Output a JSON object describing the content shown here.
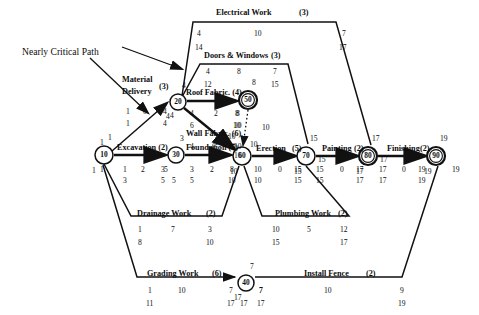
{
  "diagram": {
    "callout": {
      "label": "Nearly Critical Path"
    },
    "nodes": [
      {
        "id": "10",
        "label": "10",
        "x": 104,
        "y": 155,
        "r": 9,
        "double": false,
        "above": "1",
        "below": "1"
      },
      {
        "id": "20",
        "label": "20",
        "x": 178,
        "y": 102,
        "r": 8,
        "double": false,
        "above": "4",
        "below": "4"
      },
      {
        "id": "30",
        "label": "30",
        "x": 176,
        "y": 155,
        "r": 8,
        "double": false,
        "above": "3",
        "below": "5"
      },
      {
        "id": "40",
        "label": "40",
        "x": 246,
        "y": 283,
        "r": 8,
        "double": false,
        "above": "7",
        "below": "17"
      },
      {
        "id": "50",
        "label": "50",
        "x": 248,
        "y": 100,
        "r": 9,
        "double": true,
        "above": "8",
        "below": ""
      },
      {
        "id": "60",
        "label": "60",
        "x": 242,
        "y": 156,
        "r": 9,
        "double": false,
        "above": "",
        "below": "10"
      },
      {
        "id": "70",
        "label": "70",
        "x": 306,
        "y": 156,
        "r": 9,
        "double": false,
        "above": "15",
        "below": "15"
      },
      {
        "id": "80",
        "label": "80",
        "x": 368,
        "y": 156,
        "r": 9,
        "double": true,
        "above": "17",
        "below": "17"
      },
      {
        "id": "90",
        "label": "90",
        "x": 436,
        "y": 156,
        "r": 9,
        "double": true,
        "above": "19",
        "below": "19"
      }
    ],
    "activities": [
      {
        "name": "Material Delivery",
        "duration": "(3)",
        "early_start": "1",
        "float": "0",
        "early_finish": "4",
        "late_start": "1",
        "late_finish": "4"
      },
      {
        "name": "Roof Fabric. (4)",
        "duration": "",
        "early_start": "4",
        "float": "2",
        "early_finish": "8",
        "late_start": "6",
        "late_finish": "10"
      },
      {
        "name": "Wall Fabric. (6)",
        "duration": "",
        "early_start": "4",
        "float": "0",
        "early_finish": "10",
        "late_start": "4",
        "late_finish": "10"
      },
      {
        "name": "Excavation (2)",
        "duration": "",
        "early_start": "1",
        "float": "2",
        "early_finish": "3",
        "late_start": "3",
        "late_finish": "5"
      },
      {
        "name": "Foundation (5)",
        "duration": "",
        "early_start": "3",
        "float": "2",
        "early_finish": "8",
        "late_start": "5",
        "late_finish": "10"
      },
      {
        "name": "Erection",
        "duration": "(5)",
        "early_start": "10",
        "float": "0",
        "early_finish": "15",
        "late_start": "10",
        "late_finish": "15"
      },
      {
        "name": "Painting",
        "duration": "(2)",
        "early_start": "15",
        "float": "0",
        "early_finish": "17",
        "late_start": "15",
        "late_finish": "17"
      },
      {
        "name": "Finishing",
        "duration": "(2)",
        "early_start": "17",
        "float": "0",
        "early_finish": "19",
        "late_start": "17",
        "late_finish": "19"
      },
      {
        "name": "Electrical Work",
        "duration": "(3)",
        "early_start": "4",
        "float": "10",
        "early_finish": "7",
        "late_start": "14",
        "late_finish": "17"
      },
      {
        "name": "Doors & Windows",
        "duration": "(3)",
        "early_start": "4",
        "float": "8",
        "early_finish": "7",
        "late_start": "12",
        "late_finish": "15"
      },
      {
        "name": "Drainage Work",
        "duration": "(2)",
        "early_start": "1",
        "float": "7",
        "early_finish": "3",
        "late_start": "8",
        "late_finish": "10"
      },
      {
        "name": "Plumbing Work",
        "duration": "(2)",
        "early_start": "10",
        "float": "5",
        "early_finish": "12",
        "late_start": "15",
        "late_finish": "17"
      },
      {
        "name": "Grading Work",
        "duration": "(6)",
        "early_start": "1",
        "float": "10",
        "early_finish": "7",
        "late_start": "11",
        "late_finish": "17"
      },
      {
        "name": "Install Fence",
        "duration": "(2)",
        "early_start": "7",
        "float": "10",
        "early_finish": "9",
        "late_start": "17",
        "late_finish": "19"
      }
    ],
    "text_labels": [
      {
        "key": "callout_text",
        "text": "Nearly Critical Path",
        "x": 22,
        "y": 47,
        "cls": "callout"
      },
      {
        "key": "electrical_name",
        "text": "Electrical Work",
        "x": 216,
        "y": 9,
        "cls": "act"
      },
      {
        "key": "electrical_dur",
        "text": "(3)",
        "x": 299,
        "y": 9,
        "cls": "dur"
      },
      {
        "key": "electrical_es",
        "text": "4",
        "x": 197,
        "y": 30,
        "cls": "num"
      },
      {
        "key": "electrical_ls",
        "text": "14",
        "x": 195,
        "y": 44,
        "cls": "num"
      },
      {
        "key": "electrical_d",
        "text": "10",
        "x": 254,
        "y": 30,
        "cls": "num"
      },
      {
        "key": "electrical_ef",
        "text": "7",
        "x": 342,
        "y": 30,
        "cls": "num"
      },
      {
        "key": "electrical_lf",
        "text": "17",
        "x": 339,
        "y": 44,
        "cls": "num"
      },
      {
        "key": "doors_name",
        "text": "Doors & Windows",
        "x": 204,
        "y": 52,
        "cls": "act"
      },
      {
        "key": "doors_dur",
        "text": "(3)",
        "x": 271,
        "y": 52,
        "cls": "dur"
      },
      {
        "key": "doors_es",
        "text": "4",
        "x": 206,
        "y": 68,
        "cls": "num"
      },
      {
        "key": "doors_ls",
        "text": "12",
        "x": 204,
        "y": 81,
        "cls": "num"
      },
      {
        "key": "doors_d",
        "text": "8",
        "x": 237,
        "y": 68,
        "cls": "num"
      },
      {
        "key": "doors_ef",
        "text": "7",
        "x": 273,
        "y": 68,
        "cls": "num"
      },
      {
        "key": "doors_lf",
        "text": "15",
        "x": 271,
        "y": 81,
        "cls": "num"
      },
      {
        "key": "matdel_name1",
        "text": "Material",
        "x": 122,
        "y": 76,
        "cls": "act"
      },
      {
        "key": "matdel_name2",
        "text": "Delivery",
        "x": 122,
        "y": 88,
        "cls": "act"
      },
      {
        "key": "matdel_dur",
        "text": "(3)",
        "x": 159,
        "y": 83,
        "cls": "dur"
      },
      {
        "key": "matdel_es",
        "text": "1",
        "x": 126,
        "y": 108,
        "cls": "num"
      },
      {
        "key": "matdel_ls",
        "text": "1",
        "x": 126,
        "y": 120,
        "cls": "num"
      },
      {
        "key": "matdel_float",
        "text": "0",
        "x": 143,
        "y": 108,
        "cls": "num"
      },
      {
        "key": "matdel_ef",
        "text": "4",
        "x": 163,
        "y": 108,
        "cls": "num"
      },
      {
        "key": "matdel_lf",
        "text": "4",
        "x": 163,
        "y": 120,
        "cls": "num"
      },
      {
        "key": "roof_name",
        "text": "Roof Fabric. (4)",
        "x": 186,
        "y": 89,
        "cls": "act"
      },
      {
        "key": "roof_es",
        "text": "4",
        "x": 190,
        "y": 110,
        "cls": "num"
      },
      {
        "key": "roof_ls",
        "text": "6",
        "x": 190,
        "y": 122,
        "cls": "num"
      },
      {
        "key": "roof_float",
        "text": "2",
        "x": 214,
        "y": 110,
        "cls": "num"
      },
      {
        "key": "roof_ef",
        "text": "8",
        "x": 236,
        "y": 110,
        "cls": "num"
      },
      {
        "key": "roof_lf",
        "text": "10",
        "x": 234,
        "y": 122,
        "cls": "num"
      },
      {
        "key": "wall_name",
        "text": "Wall Fabric. (6)",
        "x": 186,
        "y": 130,
        "cls": "act"
      },
      {
        "key": "wall_es",
        "text": "4",
        "x": 190,
        "y": 143,
        "cls": "num"
      },
      {
        "key": "wall_float",
        "text": "0",
        "x": 212,
        "y": 143,
        "cls": "num"
      },
      {
        "key": "wall_ef",
        "text": "10",
        "x": 234,
        "y": 143,
        "cls": "num"
      },
      {
        "key": "wall_lf",
        "text": "10",
        "x": 234,
        "y": 152,
        "cls": "num"
      },
      {
        "key": "exc_name",
        "text": "Excavation (2)",
        "x": 117,
        "y": 144,
        "cls": "act"
      },
      {
        "key": "exc_left",
        "text": "1",
        "x": 100,
        "y": 139,
        "cls": "num"
      },
      {
        "key": "exc_es",
        "text": "1",
        "x": 123,
        "y": 166,
        "cls": "num"
      },
      {
        "key": "exc_ls",
        "text": "1",
        "x": 100,
        "y": 166,
        "cls": "num"
      },
      {
        "key": "exc_float",
        "text": "2",
        "x": 141,
        "y": 166,
        "cls": "num"
      },
      {
        "key": "exc_ef",
        "text": "3",
        "x": 161,
        "y": 166,
        "cls": "num"
      },
      {
        "key": "exc_d2",
        "text": "3",
        "x": 123,
        "y": 177,
        "cls": "num"
      },
      {
        "key": "exc_lf",
        "text": "5",
        "x": 161,
        "y": 177,
        "cls": "num"
      },
      {
        "key": "found_name",
        "text": "Foundation (5)",
        "x": 186,
        "y": 144,
        "cls": "act"
      },
      {
        "key": "found_es",
        "text": "3",
        "x": 190,
        "y": 166,
        "cls": "num"
      },
      {
        "key": "found_ls",
        "text": "5",
        "x": 190,
        "y": 177,
        "cls": "num"
      },
      {
        "key": "found_float",
        "text": "2",
        "x": 210,
        "y": 166,
        "cls": "num"
      },
      {
        "key": "found_ef",
        "text": "8",
        "x": 230,
        "y": 166,
        "cls": "num"
      },
      {
        "key": "found_lf",
        "text": "10",
        "x": 228,
        "y": 177,
        "cls": "num"
      },
      {
        "key": "n30_left_ef",
        "text": "5",
        "x": 172,
        "y": 177,
        "cls": "num"
      },
      {
        "key": "n20_dummy",
        "text": "4",
        "x": 170,
        "y": 112,
        "cls": "num"
      },
      {
        "key": "n50_right",
        "text": "10",
        "x": 262,
        "y": 124,
        "cls": "num"
      },
      {
        "key": "n50_below1",
        "text": "8",
        "x": 235,
        "y": 110,
        "cls": "num"
      },
      {
        "key": "n50_below2",
        "text": "10",
        "x": 233,
        "y": 122,
        "cls": "num"
      },
      {
        "key": "dummy_val",
        "text": "10",
        "x": 250,
        "y": 141,
        "cls": "num"
      },
      {
        "key": "n60_above1",
        "text": "10",
        "x": 228,
        "y": 133,
        "cls": "num"
      },
      {
        "key": "n60_above2",
        "text": "10",
        "x": 228,
        "y": 143,
        "cls": "num"
      },
      {
        "key": "erect_name",
        "text": "Erection",
        "x": 256,
        "y": 145,
        "cls": "act"
      },
      {
        "key": "erect_dur",
        "text": "(5)",
        "x": 292,
        "y": 145,
        "cls": "dur"
      },
      {
        "key": "erect_es",
        "text": "10",
        "x": 254,
        "y": 166,
        "cls": "num"
      },
      {
        "key": "erect_ls",
        "text": "10",
        "x": 254,
        "y": 177,
        "cls": "num"
      },
      {
        "key": "erect_float",
        "text": "0",
        "x": 278,
        "y": 166,
        "cls": "num"
      },
      {
        "key": "erect_ef",
        "text": "15",
        "x": 294,
        "y": 166,
        "cls": "num"
      },
      {
        "key": "erect_lf",
        "text": "15",
        "x": 294,
        "y": 177,
        "cls": "num"
      },
      {
        "key": "paint_name",
        "text": "Painting",
        "x": 322,
        "y": 145,
        "cls": "act"
      },
      {
        "key": "paint_dur",
        "text": "(2)",
        "x": 354,
        "y": 145,
        "cls": "dur"
      },
      {
        "key": "paint_es",
        "text": "15",
        "x": 316,
        "y": 166,
        "cls": "num"
      },
      {
        "key": "paint_ls",
        "text": "15",
        "x": 316,
        "y": 177,
        "cls": "num"
      },
      {
        "key": "paint_float",
        "text": "0",
        "x": 340,
        "y": 166,
        "cls": "num"
      },
      {
        "key": "paint_ef",
        "text": "17",
        "x": 356,
        "y": 166,
        "cls": "num"
      },
      {
        "key": "paint_lf",
        "text": "17",
        "x": 356,
        "y": 177,
        "cls": "num"
      },
      {
        "key": "fin_name",
        "text": "Finishing",
        "x": 387,
        "y": 145,
        "cls": "act"
      },
      {
        "key": "fin_dur",
        "text": "(2)",
        "x": 420,
        "y": 145,
        "cls": "dur"
      },
      {
        "key": "fin_es",
        "text": "17",
        "x": 379,
        "y": 166,
        "cls": "num"
      },
      {
        "key": "fin_ls",
        "text": "17",
        "x": 379,
        "y": 177,
        "cls": "num"
      },
      {
        "key": "fin_float",
        "text": "0",
        "x": 402,
        "y": 166,
        "cls": "num"
      },
      {
        "key": "fin_ef",
        "text": "19",
        "x": 418,
        "y": 166,
        "cls": "num"
      },
      {
        "key": "fin_lf",
        "text": "19",
        "x": 418,
        "y": 177,
        "cls": "num"
      },
      {
        "key": "n90_right",
        "text": "19",
        "x": 452,
        "y": 166,
        "cls": "num"
      },
      {
        "key": "n70_right",
        "text": "15",
        "x": 318,
        "y": 156,
        "cls": "num"
      },
      {
        "key": "n80_right",
        "text": "17",
        "x": 380,
        "y": 156,
        "cls": "num"
      },
      {
        "key": "drain_name",
        "text": "Drainage Work",
        "x": 137,
        "y": 210,
        "cls": "act"
      },
      {
        "key": "drain_dur",
        "text": "(2)",
        "x": 206,
        "y": 210,
        "cls": "dur"
      },
      {
        "key": "drain_es",
        "text": "1",
        "x": 138,
        "y": 226,
        "cls": "num"
      },
      {
        "key": "drain_ls",
        "text": "8",
        "x": 138,
        "y": 239,
        "cls": "num"
      },
      {
        "key": "drain_d",
        "text": "7",
        "x": 171,
        "y": 226,
        "cls": "num"
      },
      {
        "key": "drain_ef",
        "text": "3",
        "x": 208,
        "y": 226,
        "cls": "num"
      },
      {
        "key": "drain_lf",
        "text": "10",
        "x": 206,
        "y": 239,
        "cls": "num"
      },
      {
        "key": "plumb_name",
        "text": "Plumbing Work",
        "x": 275,
        "y": 210,
        "cls": "act"
      },
      {
        "key": "plumb_dur",
        "text": "(2)",
        "x": 338,
        "y": 210,
        "cls": "dur"
      },
      {
        "key": "plumb_es",
        "text": "10",
        "x": 272,
        "y": 226,
        "cls": "num"
      },
      {
        "key": "plumb_ls",
        "text": "15",
        "x": 272,
        "y": 239,
        "cls": "num"
      },
      {
        "key": "plumb_d",
        "text": "5",
        "x": 307,
        "y": 226,
        "cls": "num"
      },
      {
        "key": "plumb_ef",
        "text": "12",
        "x": 340,
        "y": 226,
        "cls": "num"
      },
      {
        "key": "plumb_lf",
        "text": "17",
        "x": 340,
        "y": 239,
        "cls": "num"
      },
      {
        "key": "grad_name",
        "text": "Grading Work",
        "x": 147,
        "y": 270,
        "cls": "act"
      },
      {
        "key": "grad_dur",
        "text": "(6)",
        "x": 212,
        "y": 270,
        "cls": "dur"
      },
      {
        "key": "grad_es",
        "text": "1",
        "x": 148,
        "y": 287,
        "cls": "num"
      },
      {
        "key": "grad_ls",
        "text": "11",
        "x": 146,
        "y": 300,
        "cls": "num"
      },
      {
        "key": "grad_d",
        "text": "10",
        "x": 178,
        "y": 287,
        "cls": "num"
      },
      {
        "key": "grad_ef",
        "text": "7",
        "x": 229,
        "y": 287,
        "cls": "num"
      },
      {
        "key": "grad_lf",
        "text": "17",
        "x": 227,
        "y": 300,
        "cls": "num"
      },
      {
        "key": "fence_name",
        "text": "Install Fence",
        "x": 304,
        "y": 270,
        "cls": "act"
      },
      {
        "key": "fence_dur",
        "text": "(2)",
        "x": 366,
        "y": 270,
        "cls": "dur"
      },
      {
        "key": "fence_es",
        "text": "7",
        "x": 259,
        "y": 287,
        "cls": "num"
      },
      {
        "key": "fence_ls",
        "text": "17",
        "x": 257,
        "y": 300,
        "cls": "num"
      },
      {
        "key": "fence_d",
        "text": "10",
        "x": 324,
        "y": 287,
        "cls": "num"
      },
      {
        "key": "fence_ef",
        "text": "9",
        "x": 400,
        "y": 287,
        "cls": "num"
      },
      {
        "key": "fence_lf",
        "text": "19",
        "x": 398,
        "y": 300,
        "cls": "num"
      },
      {
        "key": "n40_right",
        "text": "7",
        "x": 259,
        "y": 287,
        "cls": "num"
      },
      {
        "key": "n40_below",
        "text": "17",
        "x": 240,
        "y": 300,
        "cls": "num"
      }
    ]
  }
}
